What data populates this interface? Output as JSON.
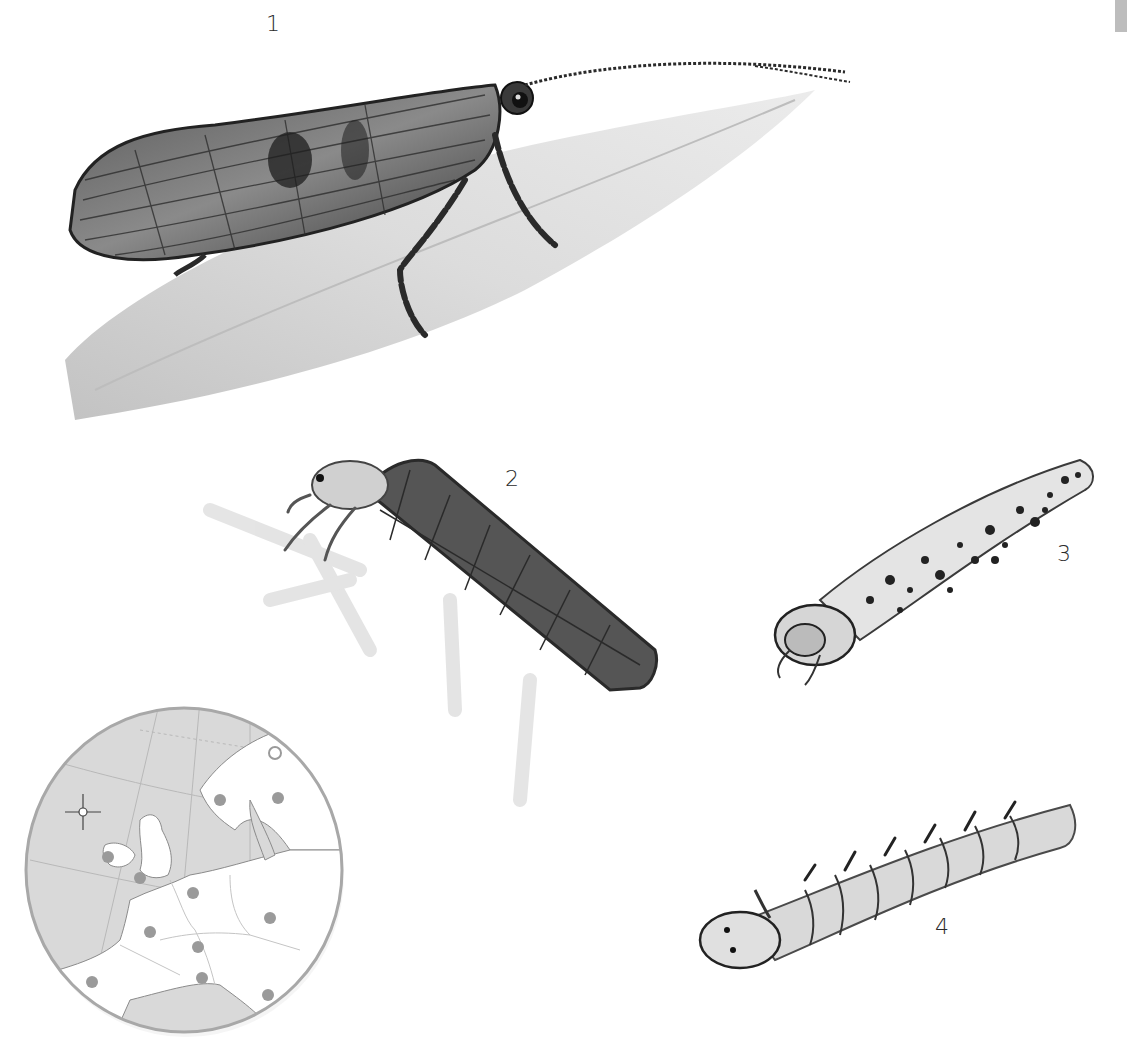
{
  "plate": {
    "background": "#ffffff",
    "edge_tab_color": "#bdbdbd"
  },
  "figures": [
    {
      "id": "1",
      "label": "1",
      "subject": "adult-caddisfly-on-leaf"
    },
    {
      "id": "2",
      "label": "2",
      "subject": "larva-in-plant-fragment-case"
    },
    {
      "id": "3",
      "label": "3",
      "subject": "larva-in-sand-grain-case"
    },
    {
      "id": "4",
      "label": "4",
      "subject": "free-living-larva"
    }
  ],
  "map": {
    "subject": "distribution-map-europe",
    "ocean_color": "#d9d9d9",
    "land_color": "#ffffff",
    "rim_color": "#a8a8a8",
    "dot_color": "#9a9a9a",
    "occurrence_dots": [
      {
        "region": "ireland"
      },
      {
        "region": "great-britain"
      },
      {
        "region": "scandinavia-west"
      },
      {
        "region": "finland"
      },
      {
        "region": "germany"
      },
      {
        "region": "eastern-europe"
      },
      {
        "region": "france"
      },
      {
        "region": "alps"
      },
      {
        "region": "italy"
      },
      {
        "region": "iberia"
      },
      {
        "region": "balkans"
      }
    ],
    "open_marker": {
      "region": "north-scandinavia"
    }
  }
}
